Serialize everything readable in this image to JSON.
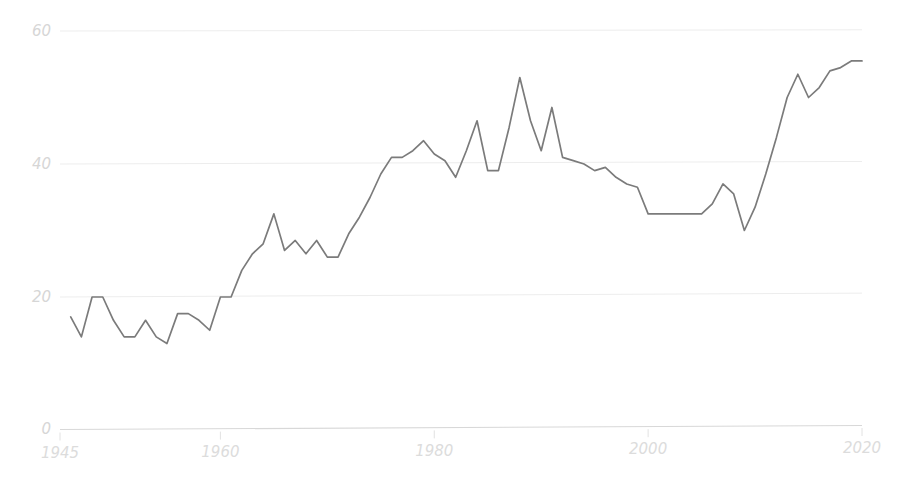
{
  "chart_data": {
    "type": "line",
    "title": "",
    "subtitle": "",
    "xlabel": "",
    "ylabel": "",
    "xlim": [
      1945,
      2021
    ],
    "ylim": [
      0,
      62
    ],
    "grid": true,
    "grid_axis": "y",
    "legend": false,
    "legend_position": "none",
    "line_color": "#7b7b7b",
    "gridline_color": "#ededed",
    "axis_color": "#d8d8d8",
    "tick_label_color": "#dcdcdc",
    "background_color": "#ffffff",
    "x_ticks": [
      1945,
      1960,
      1980,
      2000,
      2020
    ],
    "x_tick_labels": [
      "1945",
      "1960",
      "1980",
      "2000",
      "2020"
    ],
    "y_ticks": [
      0,
      20,
      40,
      60
    ],
    "y_tick_labels": [
      "0",
      "20",
      "40",
      "60"
    ],
    "series": [
      {
        "name": "series-1",
        "x": [
          1946,
          1947,
          1948,
          1949,
          1950,
          1951,
          1952,
          1953,
          1954,
          1955,
          1956,
          1957,
          1958,
          1959,
          1960,
          1961,
          1962,
          1963,
          1964,
          1965,
          1966,
          1967,
          1968,
          1969,
          1970,
          1971,
          1972,
          1973,
          1974,
          1975,
          1976,
          1977,
          1978,
          1979,
          1980,
          1981,
          1982,
          1983,
          1984,
          1985,
          1986,
          1987,
          1988,
          1989,
          1990,
          1991,
          1992,
          1993,
          1994,
          1995,
          1996,
          1997,
          1998,
          1999,
          2000,
          2001,
          2002,
          2003,
          2004,
          2005,
          2006,
          2007,
          2008,
          2009,
          2010,
          2011,
          2012,
          2013,
          2014,
          2015,
          2016,
          2017,
          2018,
          2019,
          2020
        ],
        "y": [
          17.0,
          14.0,
          20.0,
          20.0,
          16.5,
          14.0,
          14.0,
          16.5,
          14.0,
          13.0,
          17.5,
          17.5,
          16.5,
          15.0,
          20.0,
          20.0,
          24.0,
          26.5,
          28.0,
          32.5,
          27.0,
          28.5,
          26.5,
          28.5,
          26.0,
          26.0,
          29.5,
          32.0,
          35.0,
          38.5,
          41.0,
          41.0,
          42.0,
          43.5,
          41.5,
          40.5,
          38.0,
          42.0,
          46.5,
          39.0,
          39.0,
          45.5,
          53.0,
          46.5,
          42.0,
          48.5,
          41.0,
          40.5,
          40.0,
          39.0,
          39.5,
          38.0,
          37.0,
          36.5,
          32.5,
          32.5,
          32.5,
          32.5,
          32.5,
          32.5,
          34.0,
          37.0,
          35.5,
          30.0,
          33.5,
          38.5,
          44.0,
          50.0,
          53.5,
          50.0,
          51.5,
          54.0,
          54.5,
          55.5,
          55.5
        ]
      }
    ]
  },
  "plot": {
    "left_px": 60,
    "right_px": 862,
    "zero_px": 430,
    "top_px": 31
  }
}
